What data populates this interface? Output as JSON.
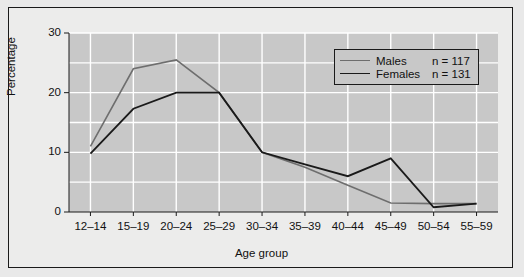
{
  "chart_data": {
    "type": "line",
    "title": "",
    "xlabel": "Age group",
    "ylabel": "Percentage",
    "categories": [
      "12–14",
      "15–19",
      "20–24",
      "25–29",
      "30–34",
      "35–39",
      "40–44",
      "45–49",
      "50–54",
      "55–59"
    ],
    "ylim": [
      0,
      30
    ],
    "yticks": [
      0,
      10,
      20,
      30
    ],
    "ytick_labels": [
      "0",
      "10",
      "20",
      "30"
    ],
    "minor_yticks": [
      5,
      15,
      25
    ],
    "grid": true,
    "legend_position": "top-right",
    "series": [
      {
        "name": "Males",
        "n_label": "n = 117",
        "color": "#6e6e6e",
        "width": 1.6,
        "values": [
          11.0,
          24.0,
          25.5,
          20.0,
          10.0,
          7.5,
          4.5,
          1.5,
          1.4,
          1.4
        ]
      },
      {
        "name": "Females",
        "n_label": "n = 131",
        "color": "#1a1a1a",
        "width": 1.8,
        "values": [
          9.8,
          17.3,
          20.0,
          20.0,
          10.0,
          8.0,
          6.0,
          9.0,
          0.8,
          1.4
        ]
      }
    ]
  },
  "figure": {
    "background": "#ececeb",
    "plot_background": "#c8c8c8",
    "border_color": "#1a1a1a",
    "gridline_color": "#ffffff"
  }
}
